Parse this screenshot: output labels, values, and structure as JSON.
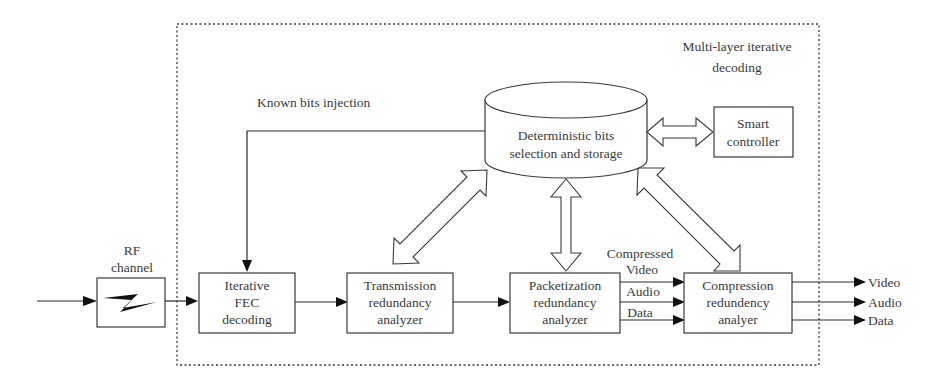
{
  "diagram": {
    "container_label": [
      "Multi-layer iterative",
      "decoding"
    ],
    "feedback_label": "Known bits injection",
    "input": {
      "rf_channel_label": [
        "RF",
        "channel"
      ]
    },
    "storage": {
      "label": [
        "Deterministic bits",
        "selection and storage"
      ]
    },
    "smart_controller": {
      "label": [
        "Smart",
        "controller"
      ]
    },
    "blocks": [
      {
        "id": "fec",
        "label": [
          "Iterative",
          "FEC",
          "decoding"
        ]
      },
      {
        "id": "transmission",
        "label": [
          "Transmission",
          "redundancy",
          "analyzer"
        ]
      },
      {
        "id": "packetization",
        "label": [
          "Packetization",
          "redundancy",
          "analyzer"
        ]
      },
      {
        "id": "compression",
        "label": [
          "Compression",
          "redundency",
          "analyer"
        ]
      }
    ],
    "stream_labels": {
      "compressed": "Compressed",
      "video": "Video",
      "audio": "Audio",
      "data": "Data"
    },
    "outputs": [
      "Video",
      "Audio",
      "Data"
    ]
  },
  "colors": {
    "stroke": "#3a3a3a",
    "background": "#ffffff",
    "text": "#3a3a3a"
  }
}
